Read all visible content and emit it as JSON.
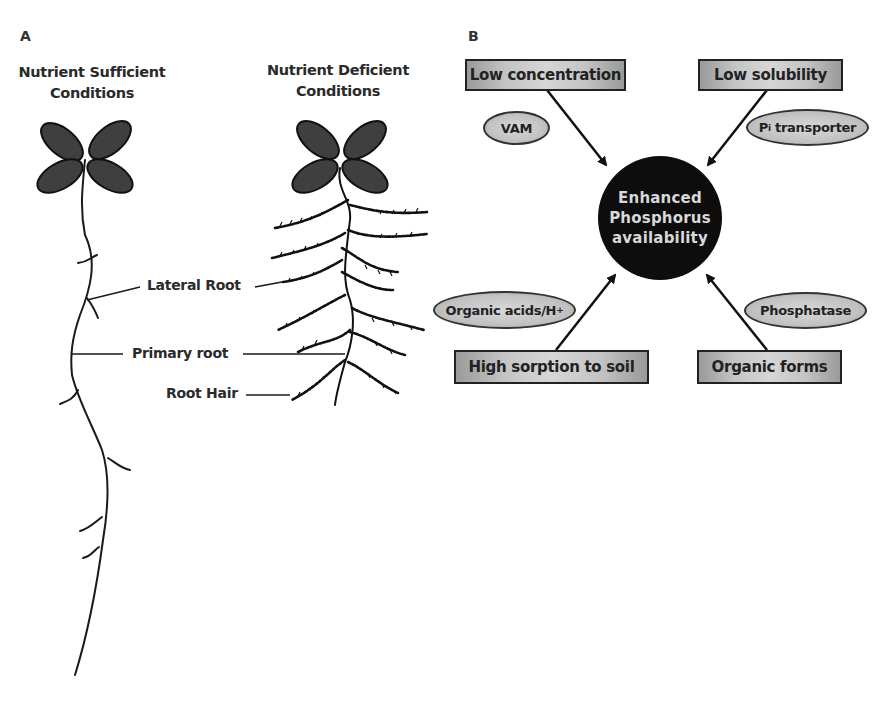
{
  "panel_a": {
    "letter": "A",
    "left_title": {
      "line1": "Nutrient Sufficient",
      "line2": "Conditions"
    },
    "right_title": {
      "line1": "Nutrient Deficient",
      "line2": "Conditions"
    },
    "labels": {
      "lateral_root": "Lateral Root",
      "primary_root": "Primary root",
      "root_hair": "Root Hair"
    }
  },
  "panel_b": {
    "letter": "B",
    "center": {
      "line1": "Enhanced",
      "line2": "Phosphorus",
      "line3": "availability"
    },
    "boxes": {
      "top_left": "Low concentration",
      "top_right": "Low solubility",
      "bottom_left": "High sorption to soil",
      "bottom_right": "Organic forms"
    },
    "ellipses": {
      "vam": "VAM",
      "pi_transporter": {
        "main": "P",
        "sub": "i",
        "rest": " transporter"
      },
      "organic_acids": {
        "main": "Organic acids/H",
        "sup": "+"
      },
      "phosphatase": "Phosphatase"
    }
  },
  "colors": {
    "leaf": "#3f3f3f",
    "line": "#1a1a1a",
    "box_fill": "#c4c4c4",
    "circle": "#0d0d0d",
    "circle_text": "#d8d8d8"
  }
}
